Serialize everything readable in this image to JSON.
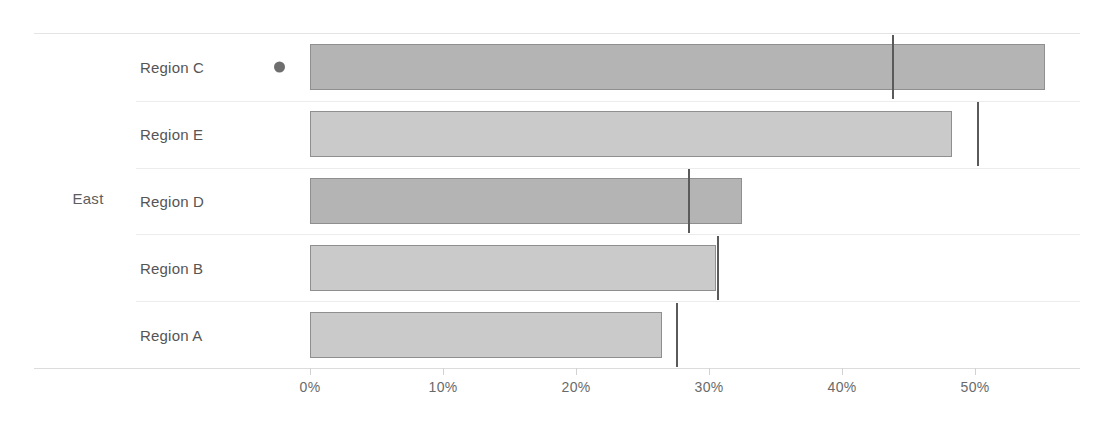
{
  "chart_data": {
    "type": "bar",
    "orientation": "horizontal",
    "title": "",
    "xlabel": "",
    "ylabel": "",
    "group_label": "East",
    "categories": [
      "Region C",
      "Region E",
      "Region D",
      "Region B",
      "Region A"
    ],
    "values": [
      55.3,
      48.3,
      32.5,
      30.5,
      26.5
    ],
    "reference_values": [
      43.8,
      50.2,
      28.5,
      30.7,
      27.6
    ],
    "xlim": [
      0,
      55.3
    ],
    "xticks": [
      0,
      10,
      20,
      30,
      40,
      50
    ],
    "xticklabels": [
      "0%",
      "10%",
      "20%",
      "30%",
      "40%",
      "50%"
    ],
    "grid": false,
    "legend": "none",
    "series": [
      {
        "name": "value",
        "values": [
          55.3,
          48.3,
          32.5,
          30.5,
          26.5
        ]
      },
      {
        "name": "target",
        "values": [
          43.8,
          50.2,
          28.5,
          30.7,
          27.6
        ]
      }
    ],
    "bars": [
      {
        "category": "Region C",
        "value": 55.3,
        "reference": 43.8,
        "shade": "dark",
        "marker": true,
        "marker_name": "selected-dot"
      },
      {
        "category": "Region E",
        "value": 48.3,
        "reference": 50.2,
        "shade": "light",
        "marker": false,
        "marker_name": ""
      },
      {
        "category": "Region D",
        "value": 32.5,
        "reference": 28.5,
        "shade": "dark",
        "marker": false,
        "marker_name": ""
      },
      {
        "category": "Region B",
        "value": 30.5,
        "reference": 30.7,
        "shade": "light",
        "marker": false,
        "marker_name": ""
      },
      {
        "category": "Region A",
        "value": 26.5,
        "reference": 27.6,
        "shade": "light",
        "marker": false,
        "marker_name": ""
      }
    ]
  },
  "colors": {
    "bar_dark": "#b4b4b4",
    "bar_light": "#cacaca",
    "bar_border": "#8f8f8f",
    "reference_line": "#5a5a5a",
    "axis_line": "#dcdcdc",
    "row_separator": "#ececec",
    "text": "#555555",
    "background": "#ffffff"
  }
}
